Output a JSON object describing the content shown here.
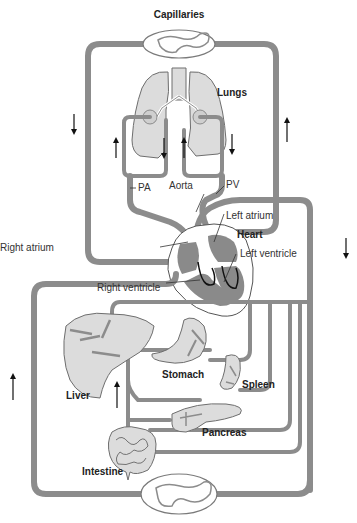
{
  "diagram": {
    "labels": {
      "capillaries": "Capillaries",
      "lungs": "Lungs",
      "pa": "PA",
      "aorta": "Aorta",
      "pv": "PV",
      "left_atrium": "Left atrium",
      "heart": "Heart",
      "right_atrium": "Right atrium",
      "left_ventricle": "Left ventricle",
      "right_ventricle": "Right ventricle",
      "liver": "Liver",
      "stomach": "Stomach",
      "spleen": "Spleen",
      "pancreas": "Pancreas",
      "intestine": "Intestine"
    },
    "flow_arrows": [
      {
        "id": "left-outer",
        "direction": "down"
      },
      {
        "id": "right-outer-upper",
        "direction": "up"
      },
      {
        "id": "lung-left-outer",
        "direction": "up"
      },
      {
        "id": "lung-left-inner",
        "direction": "down"
      },
      {
        "id": "lung-right-inner",
        "direction": "up"
      },
      {
        "id": "lung-right-outer",
        "direction": "down"
      },
      {
        "id": "right-outer-lower",
        "direction": "down"
      },
      {
        "id": "far-left-lower",
        "direction": "up"
      },
      {
        "id": "portal-vein",
        "direction": "up"
      }
    ],
    "colors": {
      "vessel": "#8c8c8c",
      "organ_fill": "#dcdcdc",
      "chamber": "#8a8a8a",
      "text": "#333333"
    }
  }
}
